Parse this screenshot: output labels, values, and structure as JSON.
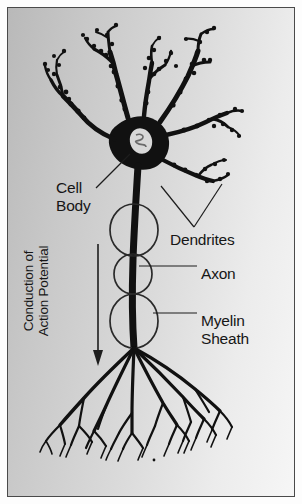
{
  "figure": {
    "kind": "neuron-anatomy-diagram",
    "background_color": "#d0d0d0",
    "ink_color": "#111111",
    "border_color": "#4a4a4a"
  },
  "labels": {
    "cell_body": {
      "line1": "Cell",
      "line2": "Body"
    },
    "dendrites": "Dendrites",
    "axon": "Axon",
    "myelin_sheath": {
      "line1": "Myelin",
      "line2": "Sheath"
    },
    "conduction": {
      "line1": "Conduction of",
      "line2": "Action Potential"
    }
  },
  "leaders": {
    "cell_body": "diagonal line from label up-right to soma",
    "dendrites": "two lines converging to a V below the right dendrites",
    "axon": "horizontal line from axon shaft to label",
    "myelin_sheath": "horizontal line from myelin ellipse to label"
  },
  "arrow": {
    "name": "conduction-direction-arrow",
    "direction": "downward",
    "meaning": "Direction of action potential conduction"
  },
  "structures": {
    "soma": {
      "name": "cell-body",
      "nucleus": "oval nucleus inside soma"
    },
    "dendrites": {
      "count": 5,
      "feature": "spiny branching processes extending upward and to the right"
    },
    "axon": {
      "name": "axon",
      "feature": "thick vertical process descending from soma"
    },
    "myelin": {
      "segments": 3,
      "shape": "ellipses wrapping the axon"
    },
    "terminals": {
      "branches": 6,
      "feature": "axon terminal arborization at the bottom"
    }
  }
}
